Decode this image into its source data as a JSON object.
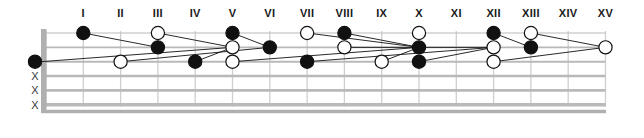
{
  "diagram": {
    "kind": "guitar-fretboard-diagram",
    "title": "",
    "fret_labels": [
      "I",
      "II",
      "III",
      "IV",
      "V",
      "VI",
      "VII",
      "VIII",
      "IX",
      "X",
      "XI",
      "XII",
      "XIII",
      "XIV",
      "XV"
    ],
    "string_count": 6,
    "fret_count": 15,
    "open_string_markers": [
      {
        "string": 3,
        "symbol": "filled"
      },
      {
        "string": 4,
        "symbol": "X"
      },
      {
        "string": 5,
        "symbol": "X"
      },
      {
        "string": 6,
        "symbol": "X"
      }
    ],
    "colors": {
      "note_filled": "#111111",
      "note_open": "#ffffff",
      "note_stroke": "#111111",
      "string": "#b9b9b9",
      "fret": "#cfcfcf",
      "nut": "#b0b0b0",
      "connector": "#111111",
      "label": "#1a1a1a",
      "background": "#ffffff"
    },
    "notes": [
      {
        "fret": 1,
        "string": 1,
        "fill": "filled"
      },
      {
        "fret": 2,
        "string": 3,
        "fill": "open"
      },
      {
        "fret": 3,
        "string": 1,
        "fill": "open"
      },
      {
        "fret": 3,
        "string": 2,
        "fill": "filled"
      },
      {
        "fret": 4,
        "string": 3,
        "fill": "filled"
      },
      {
        "fret": 5,
        "string": 1,
        "fill": "filled"
      },
      {
        "fret": 5,
        "string": 2,
        "fill": "open"
      },
      {
        "fret": 5,
        "string": 3,
        "fill": "open"
      },
      {
        "fret": 6,
        "string": 2,
        "fill": "filled"
      },
      {
        "fret": 7,
        "string": 1,
        "fill": "open"
      },
      {
        "fret": 7,
        "string": 3,
        "fill": "filled"
      },
      {
        "fret": 8,
        "string": 1,
        "fill": "filled"
      },
      {
        "fret": 8,
        "string": 2,
        "fill": "open"
      },
      {
        "fret": 9,
        "string": 3,
        "fill": "open"
      },
      {
        "fret": 10,
        "string": 1,
        "fill": "open"
      },
      {
        "fret": 10,
        "string": 2,
        "fill": "filled"
      },
      {
        "fret": 10,
        "string": 3,
        "fill": "filled"
      },
      {
        "fret": 12,
        "string": 1,
        "fill": "filled"
      },
      {
        "fret": 12,
        "string": 2,
        "fill": "open"
      },
      {
        "fret": 12,
        "string": 3,
        "fill": "open"
      },
      {
        "fret": 13,
        "string": 1,
        "fill": "open"
      },
      {
        "fret": 13,
        "string": 2,
        "fill": "filled"
      },
      {
        "fret": 15,
        "string": 2,
        "fill": "open"
      }
    ],
    "connectors": [
      {
        "from": {
          "fret": 1,
          "string": 1
        },
        "to": {
          "fret": 3,
          "string": 2
        }
      },
      {
        "from": {
          "fret": 0,
          "string": 3
        },
        "to": {
          "fret": 5,
          "string": 2
        }
      },
      {
        "from": {
          "fret": 3,
          "string": 1
        },
        "to": {
          "fret": 5,
          "string": 2
        }
      },
      {
        "from": {
          "fret": 2,
          "string": 3
        },
        "to": {
          "fret": 6,
          "string": 2
        }
      },
      {
        "from": {
          "fret": 5,
          "string": 1
        },
        "to": {
          "fret": 6,
          "string": 2
        }
      },
      {
        "from": {
          "fret": 4,
          "string": 3
        },
        "to": {
          "fret": 5,
          "string": 2
        }
      },
      {
        "from": {
          "fret": 5,
          "string": 3
        },
        "to": {
          "fret": 10,
          "string": 2
        }
      },
      {
        "from": {
          "fret": 7,
          "string": 1
        },
        "to": {
          "fret": 10,
          "string": 2
        }
      },
      {
        "from": {
          "fret": 8,
          "string": 1
        },
        "to": {
          "fret": 10,
          "string": 2
        }
      },
      {
        "from": {
          "fret": 7,
          "string": 3
        },
        "to": {
          "fret": 12,
          "string": 2
        }
      },
      {
        "from": {
          "fret": 8,
          "string": 2
        },
        "to": {
          "fret": 12,
          "string": 2
        }
      },
      {
        "from": {
          "fret": 9,
          "string": 3
        },
        "to": {
          "fret": 10,
          "string": 2
        }
      },
      {
        "from": {
          "fret": 10,
          "string": 3
        },
        "to": {
          "fret": 12,
          "string": 2
        }
      },
      {
        "from": {
          "fret": 12,
          "string": 1
        },
        "to": {
          "fret": 13,
          "string": 2
        }
      },
      {
        "from": {
          "fret": 13,
          "string": 1
        },
        "to": {
          "fret": 15,
          "string": 2
        }
      },
      {
        "from": {
          "fret": 12,
          "string": 3
        },
        "to": {
          "fret": 15,
          "string": 2
        }
      }
    ]
  }
}
